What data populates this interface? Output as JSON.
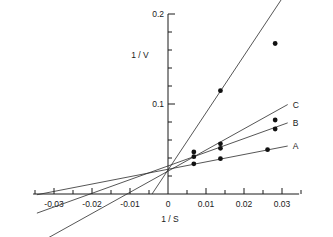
{
  "chart_data": {
    "type": "scatter",
    "title": "",
    "subtitle": "",
    "xlabel": "1 / S",
    "ylabel": "1 / V",
    "xlim": [
      -0.0355,
      0.0345
    ],
    "ylim": [
      0.0,
      0.2
    ],
    "grid": false,
    "legend_position": "right-end-of-line",
    "x_ticks": [
      -0.03,
      -0.02,
      -0.01,
      0,
      0.01,
      0.02,
      0.03
    ],
    "x_tick_labels": [
      "-0.03",
      "-0.02",
      "-0.01",
      "0",
      "0.01",
      "0.02",
      "0.03"
    ],
    "x_minor_ticks": [
      -0.035,
      -0.025,
      -0.015,
      -0.005,
      0.005,
      0.015,
      0.025,
      0.035
    ],
    "y_ticks": [
      0.1,
      0.2
    ],
    "y_tick_labels": [
      "0.1",
      "0.2"
    ],
    "y_minor_ticks": [
      0.02,
      0.04,
      0.06,
      0.08,
      0.12,
      0.14,
      0.16,
      0.18
    ],
    "series": [
      {
        "name": "A",
        "label": "A",
        "x_intercept": -0.0335,
        "slope": 0.82,
        "intercept": 0.0275,
        "points": [
          {
            "x": 0.0068,
            "y": 0.0335
          },
          {
            "x": 0.0138,
            "y": 0.0392
          },
          {
            "x": 0.0262,
            "y": 0.0492
          }
        ],
        "line_x_range": [
          -0.0345,
          0.0315
        ]
      },
      {
        "name": "B",
        "label": "B",
        "x_intercept": -0.0205,
        "slope": 1.52,
        "intercept": 0.0312,
        "points": [
          {
            "x": 0.0068,
            "y": 0.0415
          },
          {
            "x": 0.0138,
            "y": 0.0508
          },
          {
            "x": 0.0282,
            "y": 0.0722
          }
        ],
        "line_x_range": [
          -0.0345,
          0.0315
        ]
      },
      {
        "name": "C",
        "label": "C",
        "x_intercept": -0.0108,
        "slope": 2.35,
        "intercept": 0.0254,
        "points": [
          {
            "x": 0.0068,
            "y": 0.0468
          },
          {
            "x": 0.0138,
            "y": 0.0558
          },
          {
            "x": 0.0282,
            "y": 0.0822
          }
        ],
        "line_x_range": [
          -0.0345,
          0.0315
        ]
      },
      {
        "name": "D",
        "label": "D",
        "x_intercept": -0.0042,
        "slope": 6.35,
        "intercept": 0.0267,
        "points": [
          {
            "x": 0.0138,
            "y": 0.1148
          },
          {
            "x": 0.0282,
            "y": 0.1672
          }
        ],
        "line_x_range": [
          -0.0042,
          0.0315
        ]
      }
    ],
    "annotations": []
  },
  "figure": {
    "background_color": "#ffffff",
    "line_color": "#2b2b2b",
    "marker_color": "#111111",
    "axis_color": "#1a1a1a"
  }
}
